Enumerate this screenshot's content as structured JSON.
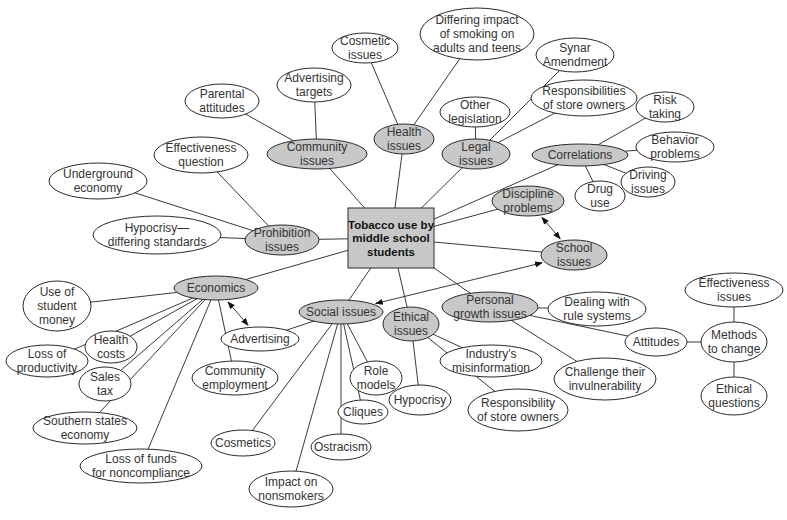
{
  "diagram": {
    "colors": {
      "primary_fill": "#c8c8c8",
      "secondary_fill": "#ffffff",
      "center_fill": "#c8c8c8",
      "stroke": "#2a2a2a"
    },
    "center": {
      "id": "center",
      "lines": [
        "Tobacco use by",
        "middle school",
        "students"
      ],
      "x": 348,
      "y": 208,
      "w": 86,
      "h": 60
    },
    "nodes": [
      {
        "id": "community",
        "lines": [
          "Community",
          "issues"
        ],
        "x": 317,
        "y": 154,
        "rx": 50,
        "ry": 15,
        "primary": true
      },
      {
        "id": "health",
        "lines": [
          "Health",
          "issues"
        ],
        "x": 404,
        "y": 139,
        "rx": 30,
        "ry": 15,
        "primary": true
      },
      {
        "id": "legal",
        "lines": [
          "Legal",
          "issues"
        ],
        "x": 476,
        "y": 154,
        "rx": 34,
        "ry": 15,
        "primary": true
      },
      {
        "id": "correlations",
        "lines": [
          "Correlations"
        ],
        "x": 580,
        "y": 155,
        "rx": 48,
        "ry": 11,
        "primary": true
      },
      {
        "id": "discipline",
        "lines": [
          "Discipline",
          "problems"
        ],
        "x": 528,
        "y": 201,
        "rx": 36,
        "ry": 15,
        "primary": true
      },
      {
        "id": "school",
        "lines": [
          "School",
          "issues"
        ],
        "x": 574,
        "y": 255,
        "rx": 33,
        "ry": 15,
        "primary": true
      },
      {
        "id": "prohibition",
        "lines": [
          "Prohibition",
          "issues"
        ],
        "x": 282,
        "y": 240,
        "rx": 37,
        "ry": 15,
        "primary": true
      },
      {
        "id": "economics",
        "lines": [
          "Economics"
        ],
        "x": 216,
        "y": 288,
        "rx": 42,
        "ry": 12,
        "primary": true
      },
      {
        "id": "social",
        "lines": [
          "Social issues"
        ],
        "x": 341,
        "y": 312,
        "rx": 42,
        "ry": 12,
        "primary": true
      },
      {
        "id": "ethical",
        "lines": [
          "Ethical",
          "issues"
        ],
        "x": 411,
        "y": 324,
        "rx": 28,
        "ry": 17,
        "primary": true
      },
      {
        "id": "personal",
        "lines": [
          "Personal",
          "growth issues"
        ],
        "x": 490,
        "y": 307,
        "rx": 48,
        "ry": 15,
        "primary": true
      },
      {
        "id": "cosmetic",
        "lines": [
          "Cosmetic",
          "issues"
        ],
        "x": 365,
        "y": 48,
        "rx": 33,
        "ry": 15
      },
      {
        "id": "differing",
        "lines": [
          "Differing impact",
          "of smoking on",
          "adults and teens"
        ],
        "x": 477,
        "y": 34,
        "rx": 57,
        "ry": 26
      },
      {
        "id": "synar",
        "lines": [
          "Synar",
          "Amendment"
        ],
        "x": 575,
        "y": 55,
        "rx": 39,
        "ry": 17
      },
      {
        "id": "other-leg",
        "lines": [
          "Other",
          "legislation"
        ],
        "x": 475,
        "y": 112,
        "rx": 35,
        "ry": 15
      },
      {
        "id": "resp-store",
        "lines": [
          "Responsibilities",
          "of store owners"
        ],
        "x": 584,
        "y": 98,
        "rx": 53,
        "ry": 18
      },
      {
        "id": "risk",
        "lines": [
          "Risk",
          "taking"
        ],
        "x": 665,
        "y": 107,
        "rx": 29,
        "ry": 15
      },
      {
        "id": "behavior",
        "lines": [
          "Behavior",
          "problems"
        ],
        "x": 675,
        "y": 147,
        "rx": 39,
        "ry": 15
      },
      {
        "id": "driving",
        "lines": [
          "Driving",
          "issues"
        ],
        "x": 648,
        "y": 182,
        "rx": 27,
        "ry": 15
      },
      {
        "id": "drug",
        "lines": [
          "Drug",
          "use"
        ],
        "x": 600,
        "y": 196,
        "rx": 25,
        "ry": 15
      },
      {
        "id": "adv-targets",
        "lines": [
          "Advertising",
          "targets"
        ],
        "x": 314,
        "y": 85,
        "rx": 37,
        "ry": 17
      },
      {
        "id": "parental",
        "lines": [
          "Parental",
          "attitudes"
        ],
        "x": 222,
        "y": 101,
        "rx": 37,
        "ry": 17
      },
      {
        "id": "effectiveness-q",
        "lines": [
          "Effectiveness",
          "question"
        ],
        "x": 201,
        "y": 155,
        "rx": 47,
        "ry": 18
      },
      {
        "id": "underground",
        "lines": [
          "Underground",
          "economy"
        ],
        "x": 98,
        "y": 181,
        "rx": 49,
        "ry": 18
      },
      {
        "id": "hypocrisy-ds",
        "lines": [
          "Hypocrisy—",
          "differing standards"
        ],
        "x": 157,
        "y": 235,
        "rx": 64,
        "ry": 19
      },
      {
        "id": "use-money",
        "lines": [
          "Use of",
          "student",
          "money"
        ],
        "x": 57,
        "y": 306,
        "rx": 34,
        "ry": 25
      },
      {
        "id": "loss-prod",
        "lines": [
          "Loss of",
          "productivity"
        ],
        "x": 47,
        "y": 361,
        "rx": 41,
        "ry": 16
      },
      {
        "id": "health-costs",
        "lines": [
          "Health",
          "costs"
        ],
        "x": 111,
        "y": 347,
        "rx": 26,
        "ry": 16
      },
      {
        "id": "sales-tax",
        "lines": [
          "Sales",
          "tax"
        ],
        "x": 105,
        "y": 384,
        "rx": 26,
        "ry": 17
      },
      {
        "id": "southern",
        "lines": [
          "Southern states",
          "economy"
        ],
        "x": 85,
        "y": 428,
        "rx": 52,
        "ry": 16
      },
      {
        "id": "loss-funds",
        "lines": [
          "Loss of funds",
          "for noncompliance"
        ],
        "x": 141,
        "y": 466,
        "rx": 61,
        "ry": 17
      },
      {
        "id": "community-emp",
        "lines": [
          "Community",
          "employment"
        ],
        "x": 235,
        "y": 378,
        "rx": 43,
        "ry": 17
      },
      {
        "id": "advertising",
        "lines": [
          "Advertising"
        ],
        "x": 260,
        "y": 339,
        "rx": 39,
        "ry": 12
      },
      {
        "id": "cosmetics",
        "lines": [
          "Cosmetics"
        ],
        "x": 243,
        "y": 443,
        "rx": 32,
        "ry": 13
      },
      {
        "id": "impact-non",
        "lines": [
          "Impact on",
          "nonsmokers"
        ],
        "x": 291,
        "y": 489,
        "rx": 42,
        "ry": 18
      },
      {
        "id": "ostracism",
        "lines": [
          "Ostracism"
        ],
        "x": 341,
        "y": 447,
        "rx": 30,
        "ry": 13
      },
      {
        "id": "cliques",
        "lines": [
          "Cliques"
        ],
        "x": 363,
        "y": 412,
        "rx": 25,
        "ry": 12
      },
      {
        "id": "role-models",
        "lines": [
          "Role",
          "models"
        ],
        "x": 376,
        "y": 378,
        "rx": 26,
        "ry": 17
      },
      {
        "id": "hypocrisy",
        "lines": [
          "Hypocrisy"
        ],
        "x": 420,
        "y": 400,
        "rx": 31,
        "ry": 15
      },
      {
        "id": "industry",
        "lines": [
          "Industry's",
          "misinformation"
        ],
        "x": 491,
        "y": 361,
        "rx": 51,
        "ry": 16
      },
      {
        "id": "resp-store2",
        "lines": [
          "Responsibility",
          "of store owners"
        ],
        "x": 518,
        "y": 410,
        "rx": 50,
        "ry": 21
      },
      {
        "id": "dealing",
        "lines": [
          "Dealing with",
          "rule systems"
        ],
        "x": 597,
        "y": 309,
        "rx": 49,
        "ry": 17
      },
      {
        "id": "challenge",
        "lines": [
          "Challenge their",
          "invulnerability"
        ],
        "x": 605,
        "y": 379,
        "rx": 51,
        "ry": 21
      },
      {
        "id": "attitudes",
        "lines": [
          "Attitudes"
        ],
        "x": 656,
        "y": 342,
        "rx": 31,
        "ry": 14
      },
      {
        "id": "methods",
        "lines": [
          "Methods",
          "to change"
        ],
        "x": 734,
        "y": 342,
        "rx": 33,
        "ry": 20
      },
      {
        "id": "effectiveness-i",
        "lines": [
          "Effectiveness",
          "issues"
        ],
        "x": 734,
        "y": 290,
        "rx": 49,
        "ry": 17
      },
      {
        "id": "ethical-q",
        "lines": [
          "Ethical",
          "questions"
        ],
        "x": 734,
        "y": 396,
        "rx": 33,
        "ry": 19
      }
    ],
    "edges": [
      [
        "center",
        "community"
      ],
      [
        "center",
        "health"
      ],
      [
        "center",
        "legal"
      ],
      [
        "center",
        "correlations"
      ],
      [
        "center",
        "discipline"
      ],
      [
        "center",
        "school"
      ],
      [
        "center",
        "prohibition"
      ],
      [
        "center",
        "economics"
      ],
      [
        "center",
        "social"
      ],
      [
        "center",
        "ethical"
      ],
      [
        "center",
        "personal"
      ],
      [
        "health",
        "cosmetic"
      ],
      [
        "health",
        "differing"
      ],
      [
        "legal",
        "synar"
      ],
      [
        "legal",
        "other-leg"
      ],
      [
        "legal",
        "resp-store"
      ],
      [
        "correlations",
        "risk"
      ],
      [
        "correlations",
        "behavior"
      ],
      [
        "correlations",
        "driving"
      ],
      [
        "correlations",
        "drug"
      ],
      [
        "community",
        "adv-targets"
      ],
      [
        "community",
        "parental"
      ],
      [
        "prohibition",
        "effectiveness-q"
      ],
      [
        "prohibition",
        "underground"
      ],
      [
        "prohibition",
        "hypocrisy-ds"
      ],
      [
        "economics",
        "use-money"
      ],
      [
        "economics",
        "loss-prod"
      ],
      [
        "economics",
        "health-costs"
      ],
      [
        "economics",
        "sales-tax"
      ],
      [
        "economics",
        "southern"
      ],
      [
        "economics",
        "loss-funds"
      ],
      [
        "economics",
        "community-emp"
      ],
      [
        "social",
        "advertising"
      ],
      [
        "social",
        "cosmetics"
      ],
      [
        "social",
        "impact-non"
      ],
      [
        "social",
        "ostracism"
      ],
      [
        "social",
        "cliques"
      ],
      [
        "social",
        "role-models"
      ],
      [
        "ethical",
        "hypocrisy"
      ],
      [
        "ethical",
        "industry"
      ],
      [
        "ethical",
        "resp-store2"
      ],
      [
        "personal",
        "dealing"
      ],
      [
        "personal",
        "challenge"
      ],
      [
        "personal",
        "attitudes"
      ],
      [
        "attitudes",
        "methods"
      ],
      [
        "methods",
        "effectiveness-i"
      ],
      [
        "methods",
        "ethical-q"
      ]
    ],
    "bidirectional_arrows": [
      [
        "discipline",
        "school"
      ],
      [
        "economics",
        "advertising"
      ],
      [
        "social",
        "school"
      ]
    ]
  }
}
